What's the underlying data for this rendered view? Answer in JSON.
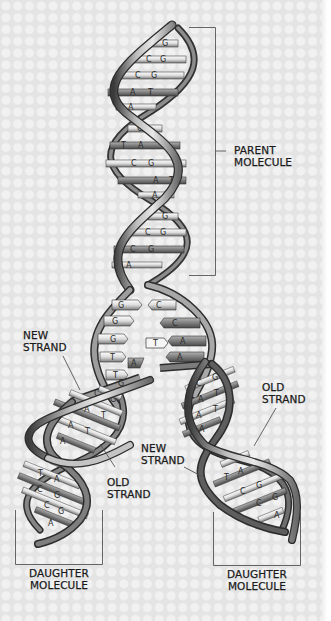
{
  "diagram": {
    "background": {
      "color": "#e4e4e4",
      "dot_color": "#f1f1f1",
      "pattern": "dot-grid"
    },
    "colors": {
      "backbone_light": "#d8d8d8",
      "backbone_mid": "#9a9a9a",
      "backbone_dark": "#3a3a3a",
      "rung_light": "#f4f4f4",
      "rung_dark": "#7a7a7a",
      "ink": "#1a1a1a"
    },
    "labels": {
      "parent": {
        "line1": "PARENT",
        "line2": "MOLECULE"
      },
      "new_strand_left": {
        "line1": "NEW",
        "line2": "STRAND"
      },
      "old_strand_left": {
        "line1": "OLD",
        "line2": "STRAND"
      },
      "new_strand_center": {
        "line1": "NEW",
        "line2": "STRAND"
      },
      "old_strand_right": {
        "line1": "OLD",
        "line2": "STRAND"
      },
      "daughter_left": {
        "line1": "DAUGHTER",
        "line2": "MOLECULE"
      },
      "daughter_right": {
        "line1": "DAUGHTER",
        "line2": "MOLECULE"
      }
    },
    "base_pairs": {
      "parent": [
        {
          "left": "C",
          "right": "G"
        },
        {
          "left": "C",
          "right": "G"
        },
        {
          "left": "C",
          "right": "G"
        },
        {
          "left": "A",
          "right": "T"
        },
        {
          "left": "A",
          "right": ""
        },
        {
          "left": "C",
          "right": "G"
        },
        {
          "left": "T",
          "right": "A"
        },
        {
          "left": "C",
          "right": "G"
        },
        {
          "left": "A",
          "right": "T"
        },
        {
          "left": "A",
          "right": ""
        },
        {
          "left": "C",
          "right": "G"
        },
        {
          "left": "C",
          "right": "G"
        },
        {
          "left": "C",
          "right": "G"
        },
        {
          "left": "A",
          "right": ""
        }
      ],
      "unzipped_left": [
        "G",
        "G",
        "G",
        "T",
        "T"
      ],
      "unzipped_right": [
        "C",
        "C",
        "A",
        "A"
      ],
      "free_nucleotides": [
        "T",
        "A"
      ],
      "daughter_left": [
        {
          "left": "",
          "right": "G"
        },
        {
          "left": "C",
          "right": "G"
        },
        {
          "left": "A",
          "right": "T"
        },
        {
          "left": "A",
          "right": "T"
        },
        {
          "left": "A",
          "right": ""
        },
        {
          "left": "",
          "right": "G"
        },
        {
          "left": "T",
          "right": "A"
        },
        {
          "left": "C",
          "right": "G"
        },
        {
          "left": "C",
          "right": "G"
        },
        {
          "left": "A",
          "right": ""
        }
      ],
      "daughter_right": [
        {
          "left": "C",
          "right": "G"
        },
        {
          "left": "A",
          "right": "T"
        },
        {
          "left": "A",
          "right": "T"
        },
        {
          "left": "A",
          "right": ""
        },
        {
          "left": "",
          "right": "G"
        },
        {
          "left": "T",
          "right": "A"
        },
        {
          "left": "C",
          "right": "G"
        },
        {
          "left": "C",
          "right": "G"
        },
        {
          "left": "",
          "right": "A"
        }
      ]
    }
  }
}
